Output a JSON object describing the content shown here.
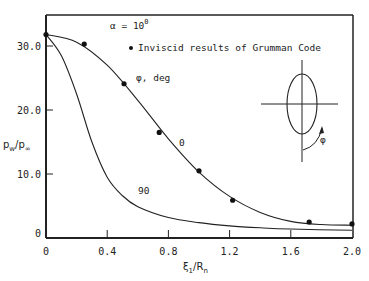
{
  "chart_data": {
    "type": "line",
    "title": "",
    "xlabel": "ξ1/Rn",
    "ylabel": "pw/p∞",
    "xlim": [
      0,
      2.0
    ],
    "ylim": [
      0,
      35
    ],
    "x_ticks": [
      "0",
      "0.4",
      "0.8",
      "1.2",
      "1.6",
      "2.0"
    ],
    "y_ticks": [
      "0",
      "10.0",
      "20.0",
      "30.0"
    ],
    "grid": false,
    "annotations": {
      "alpha": "α = 10",
      "alpha_sup": "0",
      "legend_marker": "Inviscid results of Grumman Code",
      "phi_label": "φ, deg",
      "curve_label_0": "0",
      "curve_label_90": "90",
      "inset_phi": "φ"
    },
    "series": [
      {
        "name": "φ = 0 deg (curve)",
        "x": [
          0,
          0.2,
          0.4,
          0.6,
          0.8,
          1.0,
          1.2,
          1.4,
          1.6,
          1.8,
          2.0
        ],
        "y": [
          31.8,
          30.6,
          27.0,
          21.5,
          15.5,
          10.3,
          6.5,
          4.0,
          2.6,
          2.1,
          2.0
        ]
      },
      {
        "name": "φ = 90 deg (curve)",
        "x": [
          0,
          0.1,
          0.2,
          0.3,
          0.4,
          0.5,
          0.6,
          0.8,
          1.0,
          1.2,
          1.4,
          1.6,
          2.0
        ],
        "y": [
          31.8,
          28.5,
          22.5,
          15.0,
          9.5,
          6.6,
          4.9,
          3.2,
          2.4,
          1.9,
          1.6,
          1.4,
          1.2
        ]
      },
      {
        "name": "Inviscid results of Grumman Code",
        "marker": "circle",
        "x": [
          0,
          0.25,
          0.51,
          0.74,
          1.0,
          1.22,
          1.72,
          2.0
        ],
        "y": [
          31.8,
          30.3,
          24.1,
          16.5,
          10.5,
          5.9,
          2.5,
          2.2
        ]
      }
    ]
  }
}
